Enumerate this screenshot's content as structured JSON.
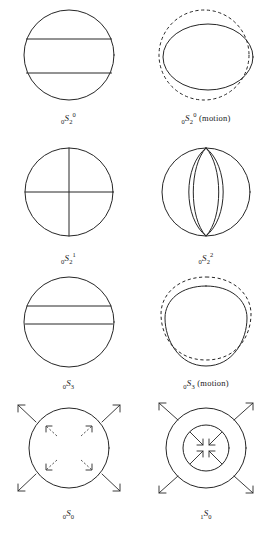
{
  "figure": {
    "type": "scientific-diagram",
    "columns": 2,
    "rows": 4,
    "stroke_color": "#262626",
    "background_color": "#ffffff"
  },
  "panels": [
    {
      "id": "panel-0s2-0",
      "label_plain": "0S2 0",
      "presub": "0",
      "symbol": "S",
      "sub": "2",
      "sup": "0",
      "suffix": "",
      "art": "sphere-two-horizontal-nodal-lines",
      "description": "Circle with two horizontal nodal lines dividing it into three zones"
    },
    {
      "id": "panel-0s2-0-motion",
      "label_plain": "0S2 0 (motion)",
      "presub": "0",
      "symbol": "S",
      "sub": "2",
      "sup": "0",
      "suffix": "(motion)",
      "art": "oblate-ellipse-with-dashed-circle",
      "description": "Solid oblate ellipse overlaid on dashed reference circle showing football-to-pancake motion"
    },
    {
      "id": "panel-0s2-1",
      "label_plain": "0S2 1",
      "presub": "0",
      "symbol": "S",
      "sub": "2",
      "sup": "1",
      "suffix": "",
      "art": "sphere-cross-nodal-lines",
      "description": "Circle with one horizontal and one vertical nodal line forming a cross"
    },
    {
      "id": "panel-0s2-2",
      "label_plain": "0S2 2",
      "presub": "0",
      "symbol": "S",
      "sub": "2",
      "sup": "2",
      "suffix": "",
      "art": "sphere-two-vertical-nodal-lines",
      "description": "Circle with two vertical lens-shaped nodal lines (meridional)"
    },
    {
      "id": "panel-0s3",
      "label_plain": "0S3",
      "presub": "0",
      "symbol": "S",
      "sub": "3",
      "sup": "",
      "suffix": "",
      "art": "sphere-two-horizontal-nodal-lines-offset",
      "description": "Circle with two horizontal nodal lines positioned in the upper half"
    },
    {
      "id": "panel-0s3-motion",
      "label_plain": "0S3 (motion)",
      "presub": "0",
      "symbol": "S",
      "sub": "3",
      "sup": "",
      "suffix": "(motion)",
      "art": "deformed-blob-with-dashed-outline",
      "description": "Solid deformed rounded-triangular shape with dashed deformed outline showing mode motion"
    },
    {
      "id": "panel-0s0",
      "label_plain": "0S0",
      "presub": "0",
      "symbol": "S",
      "sub": "0",
      "sup": "",
      "suffix": "",
      "art": "sphere-radial-breathing-outward",
      "description": "Circle with four outward diagonal arrows and four inner dashed outward arrows: radial breathing mode"
    },
    {
      "id": "panel-1s0",
      "label_plain": "1S0",
      "presub": "1",
      "symbol": "S",
      "sub": "0",
      "sup": "",
      "suffix": "",
      "art": "concentric-circles-in-out-arrows",
      "description": "Two concentric circles, inner arrows pointing inward and outer arrows pointing outward: first radial overtone"
    }
  ],
  "caption": {
    "text": ""
  }
}
